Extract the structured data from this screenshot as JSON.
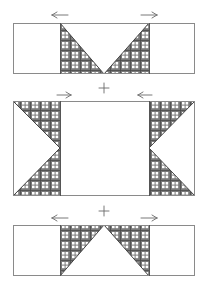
{
  "diagram": {
    "title": "Quilt block assembly: flying geese units",
    "width": 207,
    "height": 288,
    "colors": {
      "background": "#ffffff",
      "outline": "#8a8a8a",
      "plaid_base": "#7a7a7a",
      "plaid_line": "#4a4a4a",
      "plaid_window": "#ffffff"
    },
    "rows": [
      {
        "id": "top-row",
        "rect": {
          "x": 13,
          "y": 23,
          "w": 182,
          "h": 51
        },
        "dividers_x": [
          60,
          149
        ],
        "shape": "inverted-triangle",
        "apex": {
          "x": 104,
          "y": 74
        },
        "arrows": [
          {
            "direction": "left",
            "x": 60,
            "y": 15,
            "glyph": "arrow-left"
          },
          {
            "direction": "right",
            "x": 149,
            "y": 15,
            "glyph": "arrow-right"
          }
        ]
      },
      {
        "id": "middle-row",
        "rect": {
          "x": 13,
          "y": 101,
          "w": 182,
          "h": 95
        },
        "dividers_x": [
          60,
          149
        ],
        "shape": "side-triangles",
        "left_apex": {
          "x": 60,
          "y": 148
        },
        "right_apex": {
          "x": 149,
          "y": 148
        },
        "arrows": [
          {
            "direction": "right",
            "x": 64,
            "y": 95,
            "glyph": "arrow-right"
          },
          {
            "direction": "left",
            "x": 145,
            "y": 95,
            "glyph": "arrow-left"
          }
        ]
      },
      {
        "id": "bottom-row",
        "rect": {
          "x": 13,
          "y": 225,
          "w": 182,
          "h": 51
        },
        "dividers_x": [
          60,
          149
        ],
        "shape": "upright-triangle",
        "apex": {
          "x": 104,
          "y": 225
        },
        "arrows": [
          {
            "direction": "left",
            "x": 60,
            "y": 218,
            "glyph": "arrow-left"
          },
          {
            "direction": "right",
            "x": 149,
            "y": 218,
            "glyph": "arrow-right"
          }
        ]
      }
    ],
    "plus_signs": [
      {
        "x": 104,
        "y": 88,
        "glyph": "plus"
      },
      {
        "x": 104,
        "y": 211,
        "glyph": "plus"
      }
    ]
  }
}
